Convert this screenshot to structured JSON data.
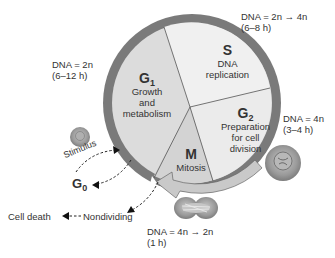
{
  "diagram": {
    "phases": [
      {
        "id": "G1",
        "letter": "G",
        "sub": "1",
        "desc": [
          "Growth",
          "and",
          "metabolism"
        ]
      },
      {
        "id": "S",
        "letter": "S",
        "sub": "",
        "desc": [
          "DNA",
          "replication"
        ]
      },
      {
        "id": "G2",
        "letter": "G",
        "sub": "2",
        "desc": [
          "Preparation",
          "for cell",
          "division"
        ]
      },
      {
        "id": "M",
        "letter": "M",
        "sub": "",
        "desc": [
          "Mitosis"
        ]
      }
    ],
    "annotations": {
      "g1_dna": "DNA = 2n",
      "g1_time": "(6–12 h)",
      "s_dna": "DNA = 2n → 4n",
      "s_time": "(6–8 h)",
      "g2_dna": "DNA = 4n",
      "g2_time": "(3–4 h)",
      "m_dna": "DNA = 4n → 2n",
      "m_time": "(1 h)"
    },
    "side": {
      "stimulus": "Stimulus",
      "g0_letter": "G",
      "g0_sub": "0",
      "cell_death": "Cell death",
      "nondividing": "Nondividing"
    },
    "colors": {
      "ring": "#7a7a7a",
      "g1_fill": "#dcdcdc",
      "s_fill": "#efefef",
      "g2_fill": "#ececec",
      "m_fill": "#d6d6d6",
      "cell": "#8d8d8d"
    }
  }
}
